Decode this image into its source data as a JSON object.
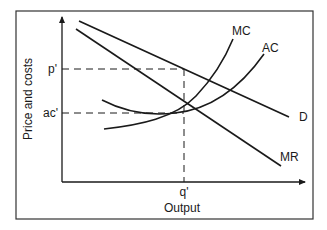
{
  "diagram": {
    "title": "",
    "axes": {
      "y_label": "Price and costs",
      "x_label": "Output"
    },
    "ticks": {
      "price": "p'",
      "average_cost": "ac'",
      "quantity": "q'"
    },
    "curves": {
      "mc": "MC",
      "ac": "AC",
      "demand": "D",
      "mr": "MR"
    },
    "colors": {
      "line": "#1a1a1a",
      "background": "#ffffff",
      "frame": "#333333"
    }
  }
}
